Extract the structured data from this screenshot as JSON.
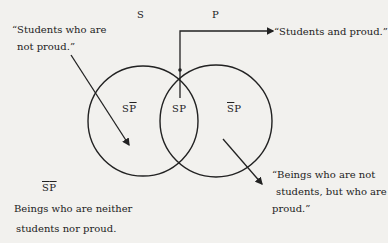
{
  "sets": {
    "s": "S",
    "p": "P"
  },
  "regions": {
    "s_not_p": {
      "a": "S",
      "b": "P"
    },
    "s_p": "SP",
    "not_s_p": {
      "a": "S",
      "b": "P"
    },
    "not_s_not_p": {
      "a": "S",
      "b": "P"
    }
  },
  "annotations": {
    "not_proud": [
      "“Students who are",
      "not proud.”"
    ],
    "students_proud": "“Students and proud.”",
    "proud_not_students": [
      "“Beings who are not",
      "students, but who are",
      "proud.”"
    ],
    "neither": [
      "Beings who are neither",
      "students nor proud."
    ]
  }
}
